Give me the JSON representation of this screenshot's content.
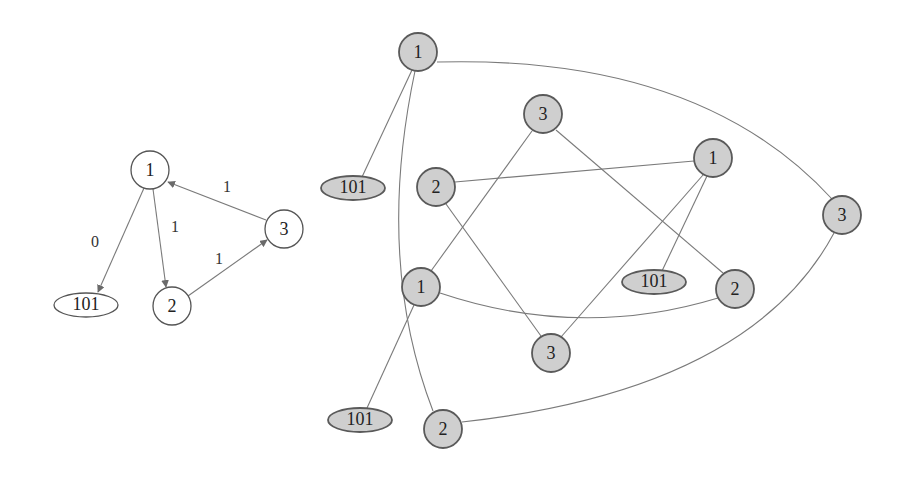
{
  "left_graph": {
    "nodes": [
      {
        "id": "n1",
        "label": "1",
        "x": 150,
        "y": 170
      },
      {
        "id": "n2",
        "label": "2",
        "x": 172,
        "y": 306
      },
      {
        "id": "n3",
        "label": "3",
        "x": 284,
        "y": 229
      },
      {
        "id": "n101",
        "label": "101",
        "x": 86,
        "y": 305
      }
    ],
    "edges": [
      {
        "from": "n1",
        "to": "n101",
        "label": "0"
      },
      {
        "from": "n1",
        "to": "n2",
        "label": "1"
      },
      {
        "from": "n2",
        "to": "n3",
        "label": "1"
      },
      {
        "from": "n3",
        "to": "n1",
        "label": "1"
      }
    ]
  },
  "right_graph": {
    "nodes": [
      {
        "id": "a1",
        "label": "1",
        "x": 418,
        "y": 52
      },
      {
        "id": "a101",
        "label": "101",
        "x": 353,
        "y": 188
      },
      {
        "id": "b3",
        "label": "3",
        "x": 543,
        "y": 114
      },
      {
        "id": "b2",
        "label": "2",
        "x": 436,
        "y": 187
      },
      {
        "id": "b1",
        "label": "1",
        "x": 713,
        "y": 158
      },
      {
        "id": "c3",
        "label": "3",
        "x": 842,
        "y": 215
      },
      {
        "id": "d1",
        "label": "1",
        "x": 421,
        "y": 287
      },
      {
        "id": "d101",
        "label": "101",
        "x": 654,
        "y": 282
      },
      {
        "id": "d2",
        "label": "2",
        "x": 735,
        "y": 289
      },
      {
        "id": "e3",
        "label": "3",
        "x": 551,
        "y": 353
      },
      {
        "id": "f101",
        "label": "101",
        "x": 360,
        "y": 420
      },
      {
        "id": "f2",
        "label": "2",
        "x": 443,
        "y": 429
      }
    ]
  }
}
